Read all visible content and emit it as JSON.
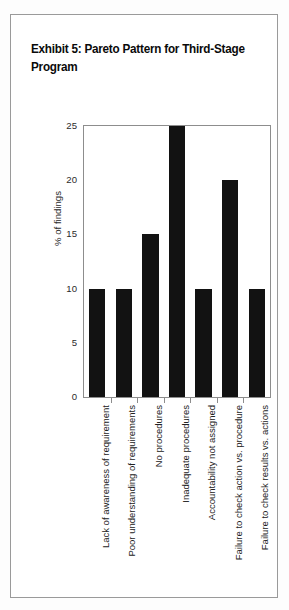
{
  "figure": {
    "title_line1": "Exhibit 5: Pareto Pattern",
    "title_line2": "for Third-Stage Program",
    "title_full": "Exhibit 5: Pareto Pattern\nfor Third-Stage Program",
    "border_color": "#9a9a9a",
    "background_color": "#ffffff"
  },
  "chart_data": {
    "type": "bar",
    "title": "Exhibit 5: Pareto Pattern for Third-Stage Program",
    "xlabel": "",
    "ylabel": "% of findings",
    "categories": [
      "Lack of awareness of requirement",
      "Poor understanding of requirements",
      "No procedures",
      "Inadequate procedures",
      "Accountability not assigned",
      "Failure to check action vs. procedure",
      "Failure to check results vs. actions"
    ],
    "values": [
      10,
      10,
      15,
      25,
      10,
      20,
      10
    ],
    "ylim": [
      0,
      25
    ],
    "ytick_labels": [
      "0",
      "5",
      "10",
      "15",
      "20",
      "25"
    ],
    "ytick_values": [
      0,
      5,
      10,
      15,
      20,
      25
    ],
    "grid": false,
    "legend": "none",
    "bar_color": "#121212",
    "axis_color": "#8d8d8d",
    "xtick_label_rotation": -90
  }
}
